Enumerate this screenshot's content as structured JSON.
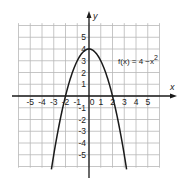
{
  "chart_data": {
    "type": "line",
    "title": "",
    "xlabel": "x",
    "ylabel": "y",
    "function_label": "f(x) = 4 −x",
    "function_label_exp": "2",
    "expression": "4 - x^2",
    "xlim": [
      -6,
      6
    ],
    "ylim": [
      -6,
      6
    ],
    "grid": true,
    "x_ticks": [
      -5,
      -4,
      -3,
      -2,
      -1,
      0,
      1,
      2,
      3,
      4,
      5
    ],
    "y_ticks": [
      5,
      4,
      3,
      2,
      1,
      -1,
      -2,
      -3,
      -4,
      -5
    ],
    "x_tick_labels": [
      "-5",
      "-4",
      "-3",
      "-2",
      "-1",
      "0",
      "1",
      "2",
      "3",
      "4",
      "5"
    ],
    "y_tick_labels": [
      "5",
      "4",
      "3",
      "2",
      "1",
      "-1",
      "-2",
      "-3",
      "-4",
      "-5"
    ],
    "series": [
      {
        "name": "f(x) = 4 - x^2",
        "x": [
          -3.2,
          -3,
          -2.5,
          -2,
          -1.5,
          -1,
          -0.5,
          0,
          0.5,
          1,
          1.5,
          2,
          2.5,
          3,
          3.2
        ],
        "y": [
          -6.24,
          -5,
          -2.25,
          0,
          1.75,
          3,
          3.75,
          4,
          3.75,
          3,
          1.75,
          0,
          -2.25,
          -5,
          -6.24
        ]
      }
    ],
    "colors": {
      "curve": "#1a1a1a",
      "axes": "#1a1a1a",
      "grid": "#b8b8b8"
    }
  }
}
